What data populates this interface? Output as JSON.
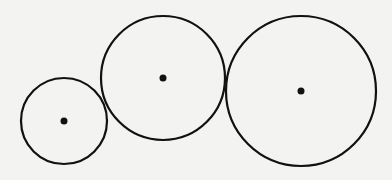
{
  "diagram": {
    "stroke_color": "#111111",
    "background_color": "#f3f3f2",
    "circles": [
      {
        "name": "small",
        "cx": 64,
        "cy": 121,
        "r": 43
      },
      {
        "name": "medium",
        "cx": 163,
        "cy": 78,
        "r": 62
      },
      {
        "name": "large",
        "cx": 301,
        "cy": 91,
        "r": 75
      }
    ]
  }
}
